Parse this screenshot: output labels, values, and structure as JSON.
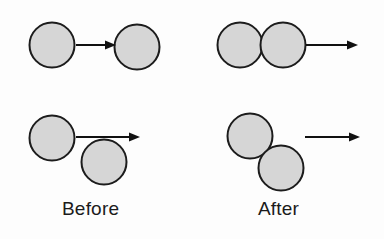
{
  "figure": {
    "type": "physics-collision-diagram",
    "background_color": "#fdfdfd",
    "ball": {
      "fill_color": "#d6d6d6",
      "stroke_color": "#1c1c1c",
      "stroke_width": 2,
      "radius": 22.5
    },
    "arrow": {
      "color": "#111111",
      "line_width": 2,
      "head_length": 11,
      "head_width": 9
    }
  },
  "labels": {
    "before": "Before",
    "after": "After"
  },
  "panels": [
    {
      "name": "head-on-before",
      "column": "before",
      "row": 1,
      "balls": [
        {
          "name": "moving-ball",
          "cx": 52,
          "cy": 45,
          "r": 22.5
        },
        {
          "name": "target-ball",
          "cx": 137,
          "cy": 47,
          "r": 22.5
        }
      ],
      "arrows": [
        {
          "name": "velocity-arrow",
          "x1": 76,
          "y1": 45,
          "x2": 116,
          "y2": 45
        }
      ]
    },
    {
      "name": "head-on-after",
      "column": "after",
      "row": 1,
      "balls": [
        {
          "name": "trailing-ball",
          "cx": 240,
          "cy": 45,
          "r": 22.5
        },
        {
          "name": "leading-ball",
          "cx": 283,
          "cy": 45,
          "r": 22.5
        }
      ],
      "arrows": [
        {
          "name": "velocity-arrow",
          "x1": 306,
          "y1": 45,
          "x2": 358,
          "y2": 45
        }
      ]
    },
    {
      "name": "glancing-before",
      "column": "before",
      "row": 2,
      "balls": [
        {
          "name": "moving-ball",
          "cx": 52,
          "cy": 138,
          "r": 22.5
        },
        {
          "name": "target-ball",
          "cx": 104,
          "cy": 162,
          "r": 22.5
        }
      ],
      "arrows": [
        {
          "name": "velocity-arrow",
          "x1": 76,
          "y1": 137,
          "x2": 140,
          "y2": 137
        }
      ]
    },
    {
      "name": "glancing-after",
      "column": "after",
      "row": 2,
      "balls": [
        {
          "name": "upper-ball",
          "cx": 250,
          "cy": 136,
          "r": 22.5
        },
        {
          "name": "lower-ball",
          "cx": 281,
          "cy": 168,
          "r": 22.5
        }
      ],
      "arrows": [
        {
          "name": "velocity-arrow",
          "x1": 305,
          "y1": 137,
          "x2": 360,
          "y2": 137
        }
      ]
    }
  ]
}
